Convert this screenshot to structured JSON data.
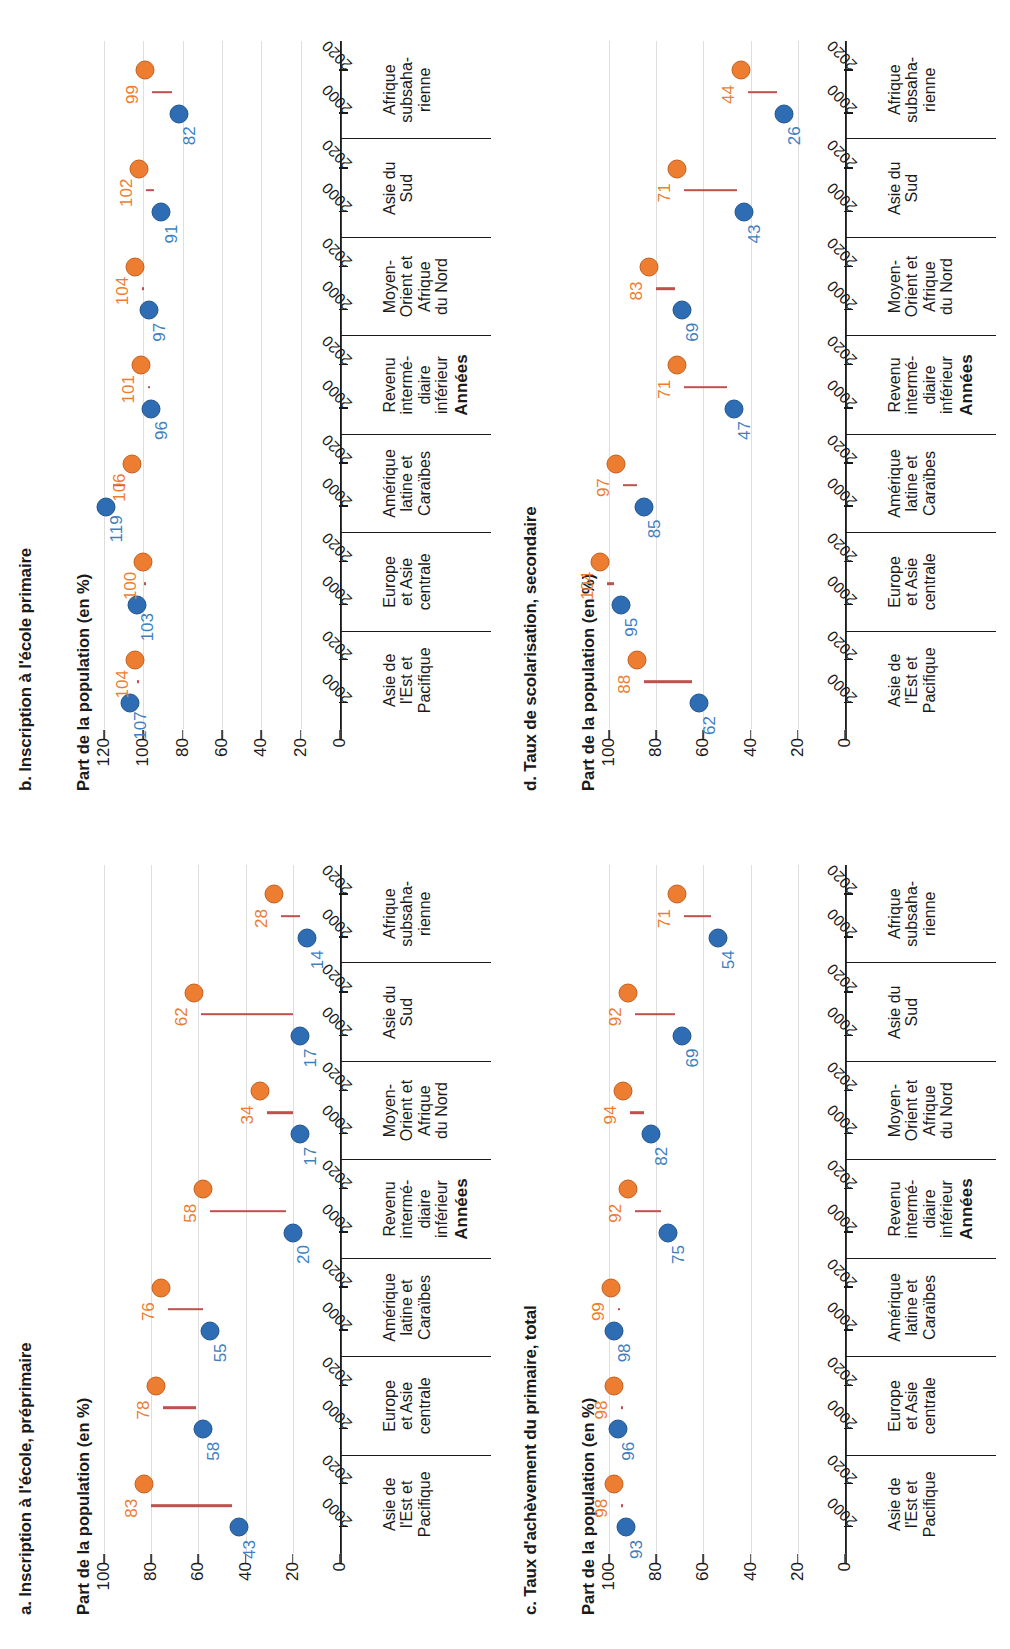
{
  "figure": {
    "axis_x_title": "Années",
    "axis_y_title": "Part de la population (en %)",
    "year_start": "2000",
    "year_end": "2020",
    "colors": {
      "series_2000": "#2e6db4",
      "series_2020": "#ed7d31",
      "connector": "#c0504d",
      "gridline": "#dedede",
      "axis": "#3d3d3d"
    }
  },
  "categories": [
    {
      "lines": [
        "Asie de",
        "l'Est et",
        "Pacifique"
      ]
    },
    {
      "lines": [
        "Europe",
        "et Asie",
        "centrale"
      ]
    },
    {
      "lines": [
        "Amérique",
        "latine et",
        "Caraïbes"
      ]
    },
    {
      "lines": [
        "Revenu",
        "intermé-",
        "diaire",
        "inférieur"
      ]
    },
    {
      "lines": [
        "Moyen-",
        "Orient et",
        "Afrique",
        "du Nord"
      ]
    },
    {
      "lines": [
        "Asie du",
        "Sud"
      ]
    },
    {
      "lines": [
        "Afrique",
        "subsaha-",
        "rienne"
      ]
    }
  ],
  "chart_data": [
    {
      "id": "a",
      "type": "line",
      "title": "a. Inscription à l'école, préprimaire",
      "xlabel": "Années",
      "ylabel": "Part de la population (en %)",
      "ylim": [
        0,
        100
      ],
      "yticks": [
        0,
        20,
        40,
        60,
        80,
        100
      ],
      "grid": true,
      "categories": [
        "Asie de l'Est et Pacifique",
        "Europe et Asie centrale",
        "Amérique latine et Caraïbes",
        "Revenu intermédiaire inférieur",
        "Moyen-Orient et Afrique du Nord",
        "Asie du Sud",
        "Afrique subsaharienne"
      ],
      "series": [
        {
          "name": "2000",
          "values": [
            43,
            58,
            55,
            20,
            17,
            17,
            14
          ]
        },
        {
          "name": "2020",
          "values": [
            83,
            78,
            76,
            58,
            34,
            62,
            28
          ]
        }
      ]
    },
    {
      "id": "b",
      "type": "line",
      "title": "b. Inscription à l'école primaire",
      "xlabel": "Années",
      "ylabel": "Part de la population (en %)",
      "ylim": [
        0,
        120
      ],
      "yticks": [
        0,
        20,
        40,
        60,
        80,
        100,
        120
      ],
      "grid": true,
      "categories": [
        "Asie de l'Est et Pacifique",
        "Europe et Asie centrale",
        "Amérique latine et Caraïbes",
        "Revenu intermédiaire inférieur",
        "Moyen-Orient et Afrique du Nord",
        "Asie du Sud",
        "Afrique subsaharienne"
      ],
      "series": [
        {
          "name": "2000",
          "values": [
            107,
            103,
            119,
            96,
            97,
            91,
            82
          ]
        },
        {
          "name": "2020",
          "values": [
            104,
            100,
            106,
            101,
            104,
            102,
            99
          ]
        }
      ]
    },
    {
      "id": "c",
      "type": "line",
      "title": "c. Taux d'achèvement du primaire, total",
      "xlabel": "Années",
      "ylabel": "Part de la population (en %)",
      "ylim": [
        0,
        100
      ],
      "yticks": [
        0,
        20,
        40,
        60,
        80,
        100
      ],
      "grid": true,
      "categories": [
        "Asie de l'Est et Pacifique",
        "Europe et Asie centrale",
        "Amérique latine et Caraïbes",
        "Revenu intermédiaire inférieur",
        "Moyen-Orient et Afrique du Nord",
        "Asie du Sud",
        "Afrique subsaharienne"
      ],
      "series": [
        {
          "name": "2000",
          "values": [
            93,
            96,
            98,
            75,
            82,
            69,
            54
          ]
        },
        {
          "name": "2020",
          "values": [
            98,
            98,
            99,
            92,
            94,
            92,
            71
          ]
        }
      ]
    },
    {
      "id": "d",
      "type": "line",
      "title": "d. Taux de scolarisation, secondaire",
      "xlabel": "Années",
      "ylabel": "Part de la population (en %)",
      "ylim": [
        0,
        100
      ],
      "yticks": [
        0,
        20,
        40,
        60,
        80,
        100
      ],
      "grid": true,
      "categories": [
        "Asie de l'Est et Pacifique",
        "Europe et Asie centrale",
        "Amérique latine et Caraïbes",
        "Revenu intermédiaire inférieur",
        "Moyen-Orient et Afrique du Nord",
        "Asie du Sud",
        "Afrique subsaharienne"
      ],
      "series": [
        {
          "name": "2000",
          "values": [
            62,
            95,
            85,
            47,
            69,
            43,
            26
          ]
        },
        {
          "name": "2020",
          "values": [
            88,
            104,
            97,
            71,
            83,
            71,
            44
          ]
        }
      ]
    }
  ]
}
